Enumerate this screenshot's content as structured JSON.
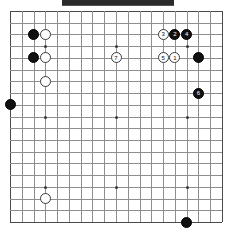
{
  "diagram": {
    "kind": "go-board-diagram",
    "board_size": 19,
    "top_bar": {
      "label": "",
      "color": "#2b2b2b"
    },
    "colors": {
      "grid_line": "#8e8e8e",
      "border_line": "#4a4a4a",
      "black_stone": "#111111",
      "white_stone": "#fdfdfd",
      "black_number_text": "#ffffff",
      "white_number_text": "#111111",
      "background": "#ffffff"
    },
    "star_points": [
      {
        "col": 3,
        "row": 3
      },
      {
        "col": 9,
        "row": 3
      },
      {
        "col": 15,
        "row": 3
      },
      {
        "col": 3,
        "row": 9
      },
      {
        "col": 9,
        "row": 9
      },
      {
        "col": 15,
        "row": 9
      },
      {
        "col": 3,
        "row": 15
      },
      {
        "col": 9,
        "row": 15
      },
      {
        "col": 15,
        "row": 15
      }
    ],
    "stones": [
      {
        "id": "s1",
        "color": "black",
        "col": 2,
        "row": 2,
        "label": ""
      },
      {
        "id": "s2",
        "color": "black",
        "col": 2,
        "row": 4,
        "label": ""
      },
      {
        "id": "s3",
        "color": "white",
        "col": 3,
        "row": 2,
        "label": ""
      },
      {
        "id": "s4",
        "color": "white",
        "col": 3,
        "row": 4,
        "label": ""
      },
      {
        "id": "s5",
        "color": "white",
        "col": 3,
        "row": 6,
        "label": ""
      },
      {
        "id": "s6",
        "color": "black",
        "col": 0,
        "row": 8,
        "label": ""
      },
      {
        "id": "s7",
        "color": "white",
        "col": 9,
        "row": 4,
        "label": "7"
      },
      {
        "id": "s8",
        "color": "white",
        "col": 13,
        "row": 2,
        "label": "3"
      },
      {
        "id": "s9",
        "color": "black",
        "col": 14,
        "row": 2,
        "label": "2"
      },
      {
        "id": "s10",
        "color": "black",
        "col": 15,
        "row": 2,
        "label": "4"
      },
      {
        "id": "s11",
        "color": "white",
        "col": 13,
        "row": 4,
        "label": "5"
      },
      {
        "id": "s12",
        "color": "white",
        "col": 14,
        "row": 4,
        "label": "1"
      },
      {
        "id": "s13",
        "color": "black",
        "col": 16,
        "row": 4,
        "label": ""
      },
      {
        "id": "s14",
        "color": "black",
        "col": 16,
        "row": 7,
        "label": "6"
      },
      {
        "id": "s15",
        "color": "white",
        "col": 3,
        "row": 16,
        "label": ""
      },
      {
        "id": "s16",
        "color": "black",
        "col": 15,
        "row": 18,
        "label": ""
      }
    ]
  }
}
